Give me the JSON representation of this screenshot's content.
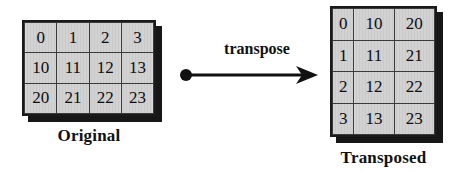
{
  "diagram": {
    "title_label": "transpose",
    "background_color": "#ffffff",
    "cell_fill_color": "#cacaca",
    "border_color": "#1a1a1a",
    "shadow_color": "#171717",
    "text_color": "#0d0d0d"
  },
  "original": {
    "caption": "Original",
    "rows": 3,
    "cols": 4,
    "cells": [
      [
        "0",
        "1",
        "2",
        "3"
      ],
      [
        "10",
        "11",
        "12",
        "13"
      ],
      [
        "20",
        "21",
        "22",
        "23"
      ]
    ]
  },
  "transposed": {
    "caption": "Transposed",
    "rows": 4,
    "cols": 3,
    "cells": [
      [
        "0",
        "10",
        "20"
      ],
      [
        "1",
        "11",
        "21"
      ],
      [
        "2",
        "12",
        "22"
      ],
      [
        "3",
        "13",
        "23"
      ]
    ]
  },
  "arrow": {
    "label": "transpose",
    "start_marker": "filled-dot",
    "end_marker": "arrowhead",
    "direction": "left-to-right",
    "color": "#111111"
  }
}
